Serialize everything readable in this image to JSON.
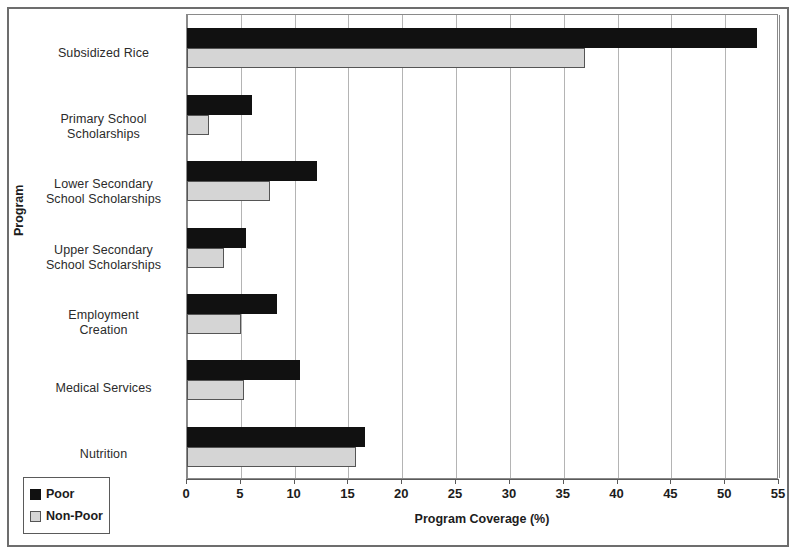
{
  "chart_data": {
    "type": "bar",
    "orientation": "horizontal",
    "title": "",
    "xlabel": "Program Coverage (%)",
    "ylabel": "Program",
    "xlim": [
      0,
      55
    ],
    "xticks": [
      0,
      5,
      10,
      15,
      20,
      25,
      30,
      35,
      40,
      45,
      50,
      55
    ],
    "grid": true,
    "grid_axis": "x",
    "legend_position": "bottom-left",
    "categories": [
      "Subsidized Rice",
      "Primary School\nScholarships",
      "Lower Secondary\nSchool Scholarships",
      "Upper Secondary\nSchool Scholarships",
      "Employment\nCreation",
      "Medical Services",
      "Nutrition"
    ],
    "series": [
      {
        "name": "Poor",
        "color": "#111111",
        "values": [
          53.0,
          6.0,
          12.1,
          5.5,
          8.4,
          10.5,
          16.5
        ]
      },
      {
        "name": "Non-Poor",
        "color": "#d5d5d5",
        "values": [
          37.0,
          2.0,
          7.7,
          3.4,
          5.0,
          5.3,
          15.7
        ]
      }
    ]
  },
  "axes": {
    "x_title": "Program Coverage (%)",
    "y_title": "Program",
    "x_tick_labels": [
      "0",
      "5",
      "10",
      "15",
      "20",
      "25",
      "30",
      "35",
      "40",
      "45",
      "50",
      "55"
    ]
  },
  "categories": {
    "c0_line1": "Subsidized Rice",
    "c0_line2": "",
    "c1_line1": "Primary School",
    "c1_line2": "Scholarships",
    "c2_line1": "Lower Secondary",
    "c2_line2": "School Scholarships",
    "c3_line1": "Upper Secondary",
    "c3_line2": "School Scholarships",
    "c4_line1": "Employment",
    "c4_line2": "Creation",
    "c5_line1": "Medical Services",
    "c5_line2": "",
    "c6_line1": "Nutrition",
    "c6_line2": ""
  },
  "legend": {
    "poor_label": "Poor",
    "nonpoor_label": "Non-Poor"
  },
  "colors": {
    "poor": "#111111",
    "nonpoor": "#d5d5d5",
    "grid": "#b4b4b4",
    "axis": "#5a5a5a"
  }
}
